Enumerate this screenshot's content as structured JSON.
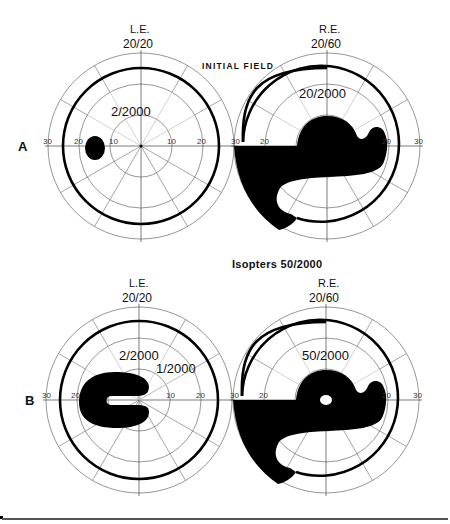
{
  "figure": {
    "captions": {
      "top_center": "INITIAL FIELD",
      "middle_center": "Isopters 50/2000"
    },
    "colors": {
      "ink": "#000000",
      "grid": "#6a6a6a",
      "background": "#ffffff"
    },
    "rows": [
      {
        "label": "A",
        "panels": [
          {
            "eye": "L.E.",
            "acuity": "20/20",
            "isopter_labels": [
              "2/2000"
            ],
            "axis_ticks": [
              "30",
              "20",
              "10",
              "10",
              "20"
            ],
            "scotoma": "small oval paracentral scotoma at ~15° temporal"
          },
          {
            "eye": "R.E.",
            "acuity": "20/60",
            "isopter_labels": [
              "20/2000"
            ],
            "axis_ticks": [
              "30",
              "20",
              "10",
              "10",
              "20",
              "30"
            ],
            "scotoma": "large central and inferior nasal field defect"
          }
        ]
      },
      {
        "label": "B",
        "panels": [
          {
            "eye": "L.E.",
            "acuity": "20/20",
            "isopter_labels": [
              "2/2000",
              "1/2000"
            ],
            "axis_ticks": [
              "30",
              "20",
              "10",
              "20"
            ],
            "scotoma": "C-shaped ring scotoma around fixation"
          },
          {
            "eye": "R.E.",
            "acuity": "20/60",
            "isopter_labels": [
              "50/2000"
            ],
            "axis_ticks": [
              "30",
              "20",
              "10",
              "20",
              "30"
            ],
            "scotoma": "large central defect with small spared island at fixation"
          }
        ]
      }
    ]
  }
}
